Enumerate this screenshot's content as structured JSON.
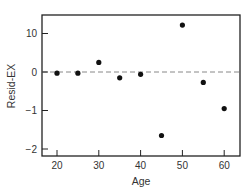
{
  "chart_data": {
    "type": "scatter",
    "title": "",
    "xlabel": "Age",
    "ylabel": "Resid-EX",
    "xlim": [
      17,
      63
    ],
    "ylim": [
      -2.2,
      1.5
    ],
    "x_ticks": [
      20,
      30,
      40,
      50,
      60
    ],
    "x_tick_labels": [
      "20",
      "30",
      "40",
      "50",
      "60"
    ],
    "y_ticks": [
      1,
      0,
      -1,
      -2
    ],
    "y_tick_labels": [
      "10",
      "0",
      "−1",
      "−2"
    ],
    "reference_line": {
      "y": 0,
      "style": "dashed",
      "color": "#888888"
    },
    "grid": false,
    "legend": null,
    "x": [
      20,
      25,
      30,
      35,
      40,
      45,
      50,
      55,
      60
    ],
    "y": [
      -0.03,
      -0.03,
      0.25,
      -0.15,
      -0.06,
      -1.65,
      1.22,
      -0.27,
      -0.95
    ],
    "marker_color": "#111111"
  }
}
